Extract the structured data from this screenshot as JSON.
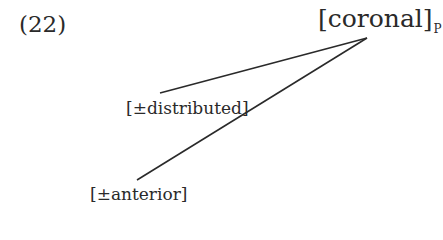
{
  "example": {
    "number": "(22)"
  },
  "tree": {
    "root": {
      "label": "[coronal]",
      "subscript": "P"
    },
    "children": [
      {
        "label": "[±distributed]"
      },
      {
        "label": "[±anterior]"
      }
    ]
  }
}
